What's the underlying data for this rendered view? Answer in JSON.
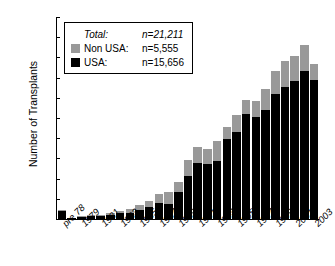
{
  "chart_data": {
    "type": "bar",
    "stacked": true,
    "title": "",
    "xlabel": "",
    "ylabel": "Number of Transplants",
    "ylim": [
      0,
      2000
    ],
    "yticks": [
      0,
      200,
      400,
      600,
      800,
      1000,
      1200,
      1400,
      1600,
      1800,
      2000
    ],
    "grid": false,
    "legend_position": "top-left",
    "categories": [
      "pre 78",
      "1978",
      "1979",
      "1980",
      "1981",
      "1982",
      "1983",
      "1984",
      "1985",
      "1986",
      "1987",
      "1988",
      "1989",
      "1990",
      "1991",
      "1992",
      "1993",
      "1994",
      "1995",
      "1996",
      "1997",
      "1998",
      "1999",
      "2000",
      "2001",
      "2002",
      "2003"
    ],
    "tick_labels": [
      "pre 78",
      "",
      "1979",
      "",
      "1981",
      "",
      "1983",
      "",
      "1985",
      "",
      "1987",
      "",
      "1989",
      "",
      "1991",
      "",
      "1993",
      "",
      "1995",
      "",
      "1997",
      "",
      "1999",
      "",
      "2001",
      "",
      "2003"
    ],
    "series": [
      {
        "name": "USA",
        "color": "#000000",
        "values": [
          80,
          10,
          22,
          28,
          32,
          42,
          58,
          62,
          88,
          120,
          160,
          150,
          265,
          430,
          550,
          548,
          575,
          790,
          860,
          1040,
          1010,
          1080,
          1240,
          1310,
          1365,
          1465,
          1375
        ]
      },
      {
        "name": "Non USA",
        "color": "#999999",
        "values": [
          10,
          3,
          5,
          7,
          10,
          13,
          25,
          38,
          50,
          62,
          90,
          115,
          105,
          155,
          160,
          150,
          200,
          125,
          165,
          135,
          160,
          205,
          230,
          250,
          250,
          255,
          155
        ]
      }
    ],
    "totals": [
      90,
      13,
      27,
      35,
      42,
      55,
      83,
      100,
      138,
      182,
      250,
      265,
      370,
      585,
      710,
      698,
      775,
      915,
      1025,
      1175,
      1170,
      1285,
      1470,
      1560,
      1615,
      1720,
      1530
    ]
  },
  "legend": {
    "rows": [
      {
        "swatch": "blank",
        "label": "Total:",
        "value": "n=21,211",
        "italic": true
      },
      {
        "swatch": "grey",
        "label": "Non USA:",
        "value": "n=5,555",
        "italic": false
      },
      {
        "swatch": "black",
        "label": "USA:",
        "value": "n=15,656",
        "italic": false
      }
    ]
  },
  "colors": {
    "usa": "#000000",
    "non_usa": "#999999",
    "axis": "#000000",
    "background": "#ffffff"
  }
}
